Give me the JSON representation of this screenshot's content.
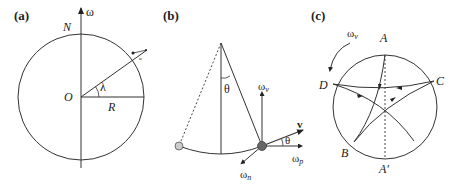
{
  "panels": {
    "a": {
      "tag": "(a)",
      "axis_label": "ω",
      "north_label": "N",
      "origin_label": "O",
      "radius_label": "R",
      "latitude_label": "λ"
    },
    "b": {
      "tag": "(b)",
      "angle_label": "θ",
      "angle_label_2": "θ",
      "omega_v": "ω",
      "omega_v_sub": "v",
      "velocity_label": "v",
      "omega_p": "ω",
      "omega_p_sub": "p",
      "omega_n": "ω",
      "omega_n_sub": "n"
    },
    "c": {
      "tag": "(c)",
      "omega_v": "ω",
      "omega_v_sub": "v",
      "point_a": "A",
      "point_a_prime": "A'",
      "point_b": "B",
      "point_c": "C",
      "point_d": "D"
    }
  },
  "colors": {
    "line": "#333333",
    "bob": "#666666",
    "bob_light": "#bbbbbb"
  }
}
